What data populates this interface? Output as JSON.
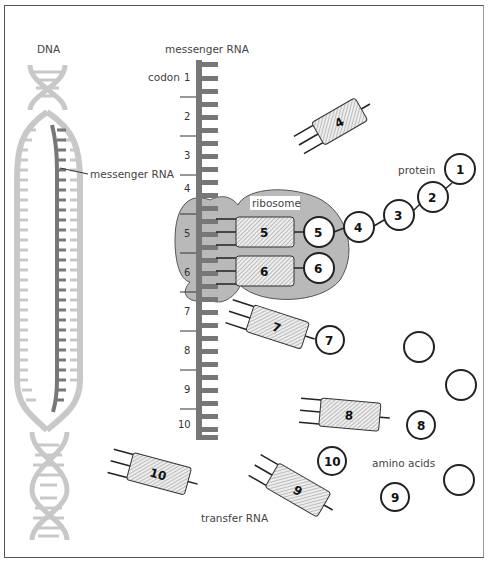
{
  "labels": {
    "dna": "DNA",
    "mrna_top": "messenger RNA",
    "mrna_inner": "messenger RNA",
    "codon": "codon",
    "ribosome": "ribosome",
    "protein": "protein",
    "trna": "transfer RNA",
    "amino_acids": "amino acids"
  },
  "codons": [
    "1",
    "2",
    "3",
    "4",
    "5",
    "6",
    "7",
    "8",
    "9",
    "10"
  ],
  "trnas": [
    {
      "id": "4",
      "label": "4"
    },
    {
      "id": "5",
      "label": "5"
    },
    {
      "id": "6",
      "label": "6"
    },
    {
      "id": "7",
      "label": "7"
    },
    {
      "id": "8",
      "label": "8"
    },
    {
      "id": "9",
      "label": "9"
    },
    {
      "id": "10",
      "label": "10"
    }
  ],
  "protein_chain": [
    "1",
    "2",
    "3",
    "4",
    "5"
  ],
  "amino_acids": {
    "attached": [
      "5",
      "6",
      "7"
    ],
    "free": [
      "8",
      "9",
      "10"
    ],
    "empty_count": 3
  },
  "colors": {
    "dna": "#c8c8c8",
    "mrna": "#777777",
    "ribosome": "#b9b9b9",
    "outline": "#222222"
  }
}
